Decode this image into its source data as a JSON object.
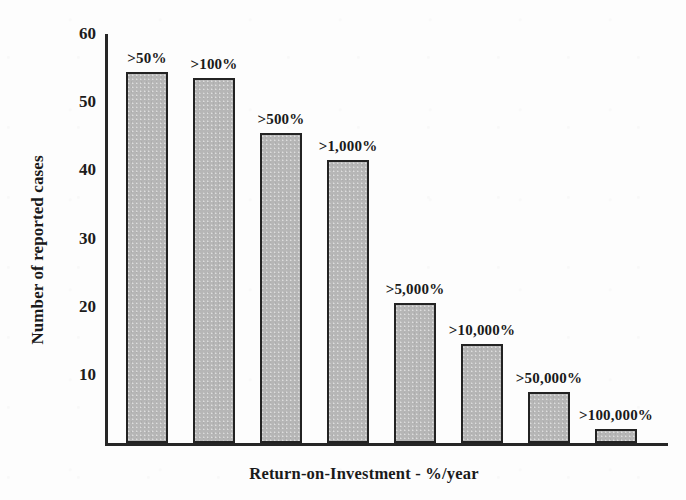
{
  "chart_data": {
    "type": "bar",
    "title": "",
    "xlabel": "Return-on-Investment - %/year",
    "ylabel": "Number of reported cases",
    "categories": [
      ">50%",
      ">100%",
      ">500%",
      ">1,000%",
      ">5,000%",
      ">10,000%",
      ">50,000%",
      ">100,000%"
    ],
    "values": [
      54.5,
      53.5,
      45.5,
      41.5,
      20.5,
      14.5,
      7.5,
      2
    ],
    "ylim": [
      0,
      60
    ],
    "yticks": [
      10,
      20,
      30,
      40,
      50,
      60
    ],
    "ytick_labels": [
      "10",
      "20",
      "30",
      "40",
      "50",
      "60"
    ],
    "grid": false,
    "legend": false,
    "bar_labels_position": "above-bar",
    "colors": {
      "bar_fill": "#b6b6b6",
      "bar_edge": "#232323",
      "axis": "#262626",
      "text": "#1a1a1a",
      "background": "#fdfdfd"
    }
  }
}
